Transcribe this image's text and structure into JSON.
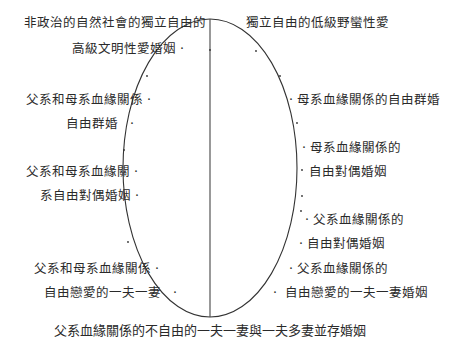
{
  "diagram": {
    "top_left_line1": "非政治的自然社會的獨立自由的",
    "top_left_line2": "高級文明性愛婚姻",
    "top_right": "獨立自由的低級野蠻性愛",
    "left": [
      {
        "line1": "父系和母系血緣關係",
        "line2": "自由群婚"
      },
      {
        "line1": "父系和母系血緣關",
        "line2": "系自由對偶婚姻"
      },
      {
        "line1": "父系和母系血緣關係",
        "line2": "自由戀愛的一夫一妻"
      }
    ],
    "right": [
      {
        "line1": "母系血緣關係的自由群婚"
      },
      {
        "line1": "母系血緣關係的",
        "line2": "自由對偶婚姻"
      },
      {
        "line1": "父系血緣關係的",
        "line2": "自由對偶婚姻"
      },
      {
        "line1": "父系血緣關係的",
        "line2": "自由戀愛的一夫一妻婚姻"
      }
    ],
    "bottom": "父系血緣關係的不自由的一夫一妻與一夫多妻並存婚姻",
    "dot_glyph": "·"
  }
}
